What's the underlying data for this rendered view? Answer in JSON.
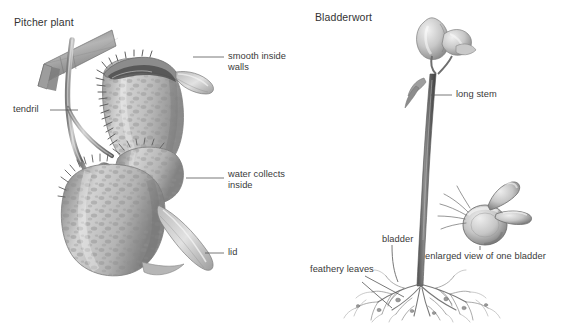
{
  "figure": {
    "background_color": "#ffffff",
    "label_color": "#3a3a3a",
    "title_color": "#333333",
    "leader_color": "#555555",
    "ink_dark": "#5a5a5a",
    "ink_mid": "#8d8d8d",
    "ink_light": "#c3c3c3"
  },
  "panels": {
    "pitcher": {
      "title": "Pitcher plant",
      "labels": {
        "smooth_inside_walls": "smooth inside\nwalls",
        "tendril": "tendril",
        "water_collects_inside": "water collects\ninside",
        "lid": "lid"
      }
    },
    "bladderwort": {
      "title": "Bladderwort",
      "labels": {
        "long_stem": "long stem",
        "bladder": "bladder",
        "feathery_leaves": "feathery leaves",
        "enlarged_view": "enlarged view of one bladder"
      }
    }
  }
}
